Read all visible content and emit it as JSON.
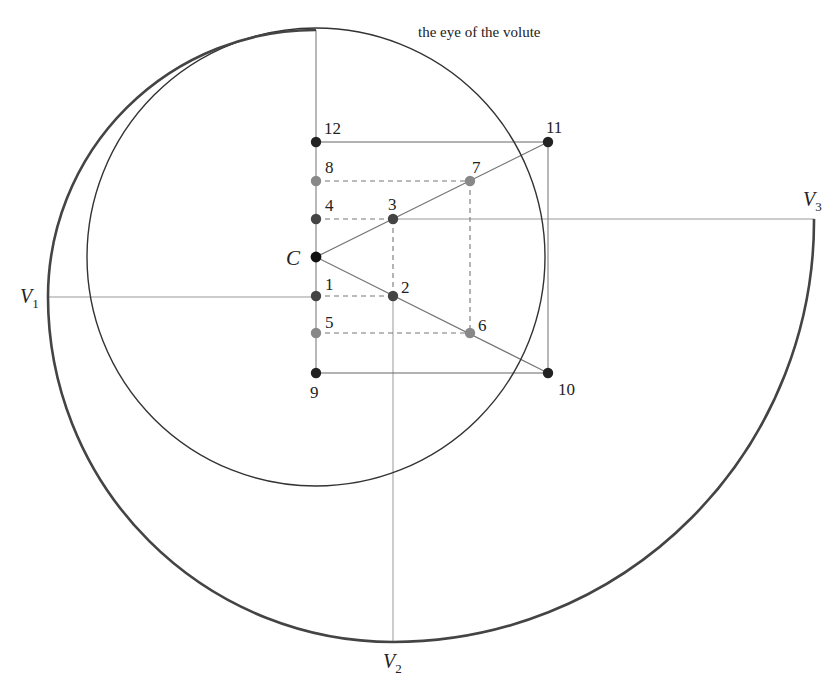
{
  "diagram": {
    "title": "the eye of the volute",
    "center": {
      "label": "C",
      "x": 316,
      "y": 257,
      "color": "#111111"
    },
    "eye_circle": {
      "cx": 316,
      "cy": 257,
      "r": 229
    },
    "points": [
      {
        "id": "1",
        "label": "1",
        "x": 316,
        "y": 296,
        "color": "#444444"
      },
      {
        "id": "2",
        "label": "2",
        "x": 393,
        "y": 296,
        "color": "#444444"
      },
      {
        "id": "3",
        "label": "3",
        "x": 393,
        "y": 219,
        "color": "#444444"
      },
      {
        "id": "4",
        "label": "4",
        "x": 316,
        "y": 219,
        "color": "#444444"
      },
      {
        "id": "5",
        "label": "5",
        "x": 316,
        "y": 333,
        "color": "#888888"
      },
      {
        "id": "6",
        "label": "6",
        "x": 470,
        "y": 333,
        "color": "#888888"
      },
      {
        "id": "7",
        "label": "7",
        "x": 470,
        "y": 181,
        "color": "#888888"
      },
      {
        "id": "8",
        "label": "8",
        "x": 316,
        "y": 181,
        "color": "#888888"
      },
      {
        "id": "9",
        "label": "9",
        "x": 316,
        "y": 373,
        "color": "#222222"
      },
      {
        "id": "10",
        "label": "10",
        "x": 548,
        "y": 373,
        "color": "#222222"
      },
      {
        "id": "11",
        "label": "11",
        "x": 548,
        "y": 142,
        "color": "#222222"
      },
      {
        "id": "12",
        "label": "12",
        "x": 316,
        "y": 142,
        "color": "#222222"
      }
    ],
    "volute_points": [
      {
        "id": "V1",
        "main": "V",
        "sub": "1",
        "x": 48,
        "y": 297
      },
      {
        "id": "V2",
        "main": "V",
        "sub": "2",
        "x": 393,
        "y": 642
      },
      {
        "id": "V3",
        "main": "V",
        "sub": "3",
        "x": 814,
        "y": 219
      }
    ],
    "spiral_arcs": [
      {
        "center": "1",
        "from": [
          316,
          30
        ],
        "to": [
          48,
          297
        ]
      },
      {
        "center": "2",
        "from": [
          48,
          297
        ],
        "to": [
          393,
          642
        ]
      },
      {
        "center": "3",
        "from": [
          393,
          642
        ],
        "to": [
          814,
          219
        ]
      }
    ],
    "labels": {
      "title": "the eye of the volute",
      "C": "C",
      "p1": "1",
      "p2": "2",
      "p3": "3",
      "p4": "4",
      "p5": "5",
      "p6": "6",
      "p7": "7",
      "p8": "8",
      "p9": "9",
      "p10": "10",
      "p11": "11",
      "p12": "12",
      "V": "V",
      "V1sub": "1",
      "V2sub": "2",
      "V3sub": "3"
    },
    "colors": {
      "stroke_thin": "#555555",
      "stroke_guide": "#999999",
      "stroke_spiral": "#444444",
      "eye_circle": "#333333"
    }
  }
}
